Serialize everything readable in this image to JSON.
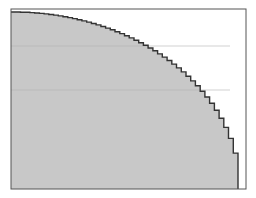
{
  "chart_data": {
    "type": "area",
    "title": "",
    "xlabel": "",
    "ylabel": "",
    "x": [
      0.0,
      0.1,
      0.2,
      0.3,
      0.4,
      0.5,
      0.6,
      0.7,
      0.8,
      0.9,
      0.95,
      1.0
    ],
    "values": [
      1.0,
      0.995,
      0.98,
      0.954,
      0.917,
      0.866,
      0.8,
      0.714,
      0.6,
      0.436,
      0.312,
      0.0
    ],
    "xlim": [
      0,
      1
    ],
    "ylim": [
      0,
      1
    ],
    "grid": {
      "horizontal_lines_y": [
        0.8,
        0.56
      ]
    },
    "colors": {
      "fill": "#c8c8c8",
      "edge": "#333333",
      "frame": "#555555",
      "background": "#ffffff",
      "grid": "#b4b4b4"
    },
    "frame": {
      "left": 11,
      "top": 9,
      "right": 246,
      "bottom": 189
    },
    "curve_px": {
      "x0": 11,
      "y_top": 12,
      "x_end": 238,
      "y_bottom": 189,
      "steps": 48
    }
  }
}
